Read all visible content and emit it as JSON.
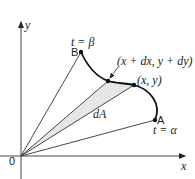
{
  "diagram": {
    "axes": {
      "x_label": "x",
      "y_label": "y",
      "origin_label": "0"
    },
    "points": {
      "B": {
        "label": "B",
        "param": "t = β"
      },
      "A": {
        "label": "A",
        "param": "t = α"
      },
      "P": {
        "label": "(x, y)"
      },
      "Q": {
        "label": "(x + dx, y + dy)"
      }
    },
    "area_label": "dA",
    "colors": {
      "line": "#222222",
      "shaded_area": "#e6e6e6",
      "axis": "#555555"
    }
  }
}
